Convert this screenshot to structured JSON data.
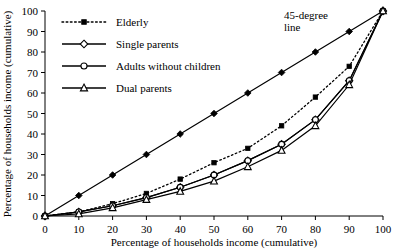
{
  "chart_data": {
    "type": "line",
    "title": "",
    "xlabel": "Percentage of households income (cumulative)",
    "ylabel": "Percentage of households income (cumulative)",
    "xlim": [
      0,
      100
    ],
    "ylim": [
      0,
      100
    ],
    "grid": false,
    "legend_position": "upper-left",
    "x_ticks": [
      "0",
      "10",
      "20",
      "30",
      "40",
      "50",
      "60",
      "70",
      "80",
      "90",
      "100"
    ],
    "y_ticks": [
      "0",
      "10",
      "20",
      "30",
      "40",
      "50",
      "60",
      "70",
      "80",
      "90",
      "100"
    ],
    "x": [
      0,
      10,
      20,
      30,
      40,
      50,
      60,
      70,
      80,
      90,
      100
    ],
    "annotations": [
      {
        "text": "45-degree\nline",
        "line1": "45-degree",
        "line2": "line",
        "x": 62,
        "y": 94
      }
    ],
    "series": [
      {
        "name": "45-degree line",
        "marker": "filled-diamond",
        "linestyle": "solid",
        "show_in_legend": false,
        "values": [
          0,
          10,
          20,
          30,
          40,
          50,
          60,
          70,
          80,
          90,
          100
        ]
      },
      {
        "name": "Elderly",
        "marker": "filled-square",
        "linestyle": "dotted",
        "show_in_legend": true,
        "values": [
          0,
          2,
          6,
          11,
          18,
          26,
          33,
          44,
          58,
          73,
          100
        ]
      },
      {
        "name": "Single parents",
        "marker": "open-diamond",
        "linestyle": "solid",
        "show_in_legend": true,
        "values": [
          0,
          2,
          5,
          9,
          14,
          20,
          27,
          35,
          47,
          66,
          100
        ]
      },
      {
        "name": "Adults without children",
        "marker": "open-circle",
        "linestyle": "solid",
        "show_in_legend": true,
        "values": [
          0,
          2,
          5,
          9,
          14,
          20,
          27,
          35,
          47,
          66,
          100
        ]
      },
      {
        "name": "Dual parents",
        "marker": "open-triangle",
        "linestyle": "solid",
        "show_in_legend": true,
        "values": [
          0,
          1,
          4,
          8,
          12,
          17,
          24,
          32,
          44,
          64,
          100
        ]
      }
    ]
  },
  "legend": {
    "items": [
      {
        "label": "Elderly",
        "marker": "filled-square",
        "linestyle": "dotted"
      },
      {
        "label": "Single parents",
        "marker": "open-diamond",
        "linestyle": "solid"
      },
      {
        "label": "Adults without children",
        "marker": "open-circle",
        "linestyle": "solid"
      },
      {
        "label": "Dual parents",
        "marker": "open-triangle",
        "linestyle": "solid"
      }
    ]
  },
  "colors": {
    "ink": "#000000",
    "background": "#ffffff"
  }
}
